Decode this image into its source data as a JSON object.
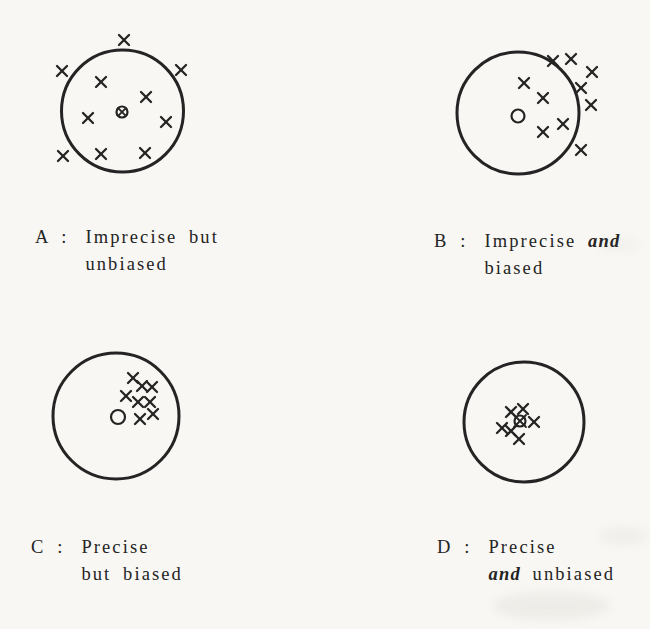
{
  "style": {
    "paper": "#f8f7f3",
    "ink": "#242424",
    "smudge": "#8d887f",
    "circle_stroke": 3,
    "x_stroke": 2.3,
    "x_half": 5,
    "center_stroke": 2.2
  },
  "panels": [
    {
      "letter": "A",
      "prefix": "A :",
      "caption": {
        "line1_pre": "Imprecise but",
        "line1_italic": "",
        "line2_italic": "",
        "line2_post": "unbiased"
      },
      "circle": {
        "cx": 122.5,
        "cy": 111,
        "r": 61
      },
      "center": {
        "type": "circle-x",
        "x": 122,
        "y": 112,
        "r": 5.5,
        "xs": 3.6
      },
      "points": [
        [
          124,
          40
        ],
        [
          62,
          71
        ],
        [
          181,
          70
        ],
        [
          101,
          82
        ],
        [
          146,
          97
        ],
        [
          88,
          118
        ],
        [
          166,
          122
        ],
        [
          63,
          156
        ],
        [
          101,
          154
        ],
        [
          145,
          153
        ]
      ]
    },
    {
      "letter": "B",
      "prefix": "B :",
      "caption": {
        "line1_pre": "Imprecise ",
        "line1_italic": "and",
        "line2_italic": "",
        "line2_post": "biased"
      },
      "circle": {
        "cx": 518,
        "cy": 113,
        "r": 61
      },
      "center": {
        "type": "circle",
        "x": 518,
        "y": 116,
        "r": 6.5
      },
      "points": [
        [
          524,
          83
        ],
        [
          553,
          61
        ],
        [
          571,
          59
        ],
        [
          592,
          72
        ],
        [
          581,
          88
        ],
        [
          543,
          98
        ],
        [
          591,
          105
        ],
        [
          563,
          124
        ],
        [
          543,
          132
        ],
        [
          581,
          150
        ]
      ]
    },
    {
      "letter": "C",
      "prefix": "C :",
      "caption": {
        "line1_pre": "Precise",
        "line1_italic": "",
        "line2_italic": "",
        "line2_post": "but biased"
      },
      "circle": {
        "cx": 116,
        "cy": 416,
        "r": 63
      },
      "center": {
        "type": "circle",
        "x": 118,
        "y": 417,
        "r": 7
      },
      "points": [
        [
          133,
          378
        ],
        [
          142,
          386
        ],
        [
          152,
          387
        ],
        [
          126,
          396
        ],
        [
          138,
          402
        ],
        [
          150,
          402
        ],
        [
          153,
          414
        ],
        [
          140,
          419
        ]
      ]
    },
    {
      "letter": "D",
      "prefix": "D :",
      "caption": {
        "line1_pre": "Precise",
        "line1_italic": "",
        "line2_italic": "and",
        "line2_post": " unbiased"
      },
      "circle": {
        "cx": 524,
        "cy": 422,
        "r": 60
      },
      "center": {
        "type": "circle-x",
        "x": 520,
        "y": 421,
        "r": 5.5,
        "xs": 6
      },
      "points": [
        [
          511,
          412
        ],
        [
          523,
          409
        ],
        [
          534,
          422
        ],
        [
          502,
          428
        ],
        [
          511,
          431
        ],
        [
          519,
          439
        ]
      ]
    }
  ]
}
